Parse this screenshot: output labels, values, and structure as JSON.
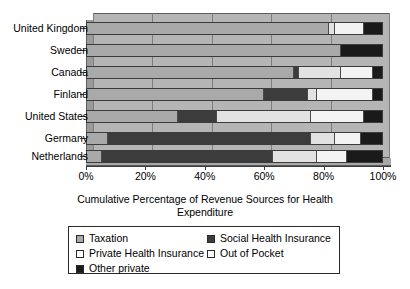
{
  "chart_data": {
    "type": "bar",
    "orientation": "horizontal",
    "stacked": true,
    "title": "",
    "xlabel": "Cumulative Percentage of Revenue Sources for Health Expenditure",
    "ylabel": "",
    "xlim": [
      0,
      100
    ],
    "xticks": [
      "0%",
      "20%",
      "40%",
      "60%",
      "80%",
      "100%"
    ],
    "xtick_values": [
      0,
      20,
      40,
      60,
      80,
      100
    ],
    "grid": true,
    "legend_position": "bottom",
    "categories": [
      "United Kingdom",
      "Sweden",
      "Canada",
      "Finland",
      "United States",
      "Germany",
      "Netherlands"
    ],
    "series": [
      {
        "name": "Taxation",
        "color": "#a9a9a9",
        "values": [
          82,
          86,
          70,
          60,
          31,
          7,
          5
        ]
      },
      {
        "name": "Social Health Insurance",
        "color": "#3c3c3c",
        "values": [
          0,
          0,
          2,
          15,
          13,
          69,
          58
        ]
      },
      {
        "name": "Out of Pocket",
        "color": "#e2e2e2",
        "values": [
          2,
          0,
          14,
          3,
          32,
          8,
          15
        ]
      },
      {
        "name": "Private Health Insurance",
        "color": "#f3f3f3",
        "values": [
          10,
          0,
          11,
          19,
          18,
          9,
          10
        ]
      },
      {
        "name": "Other private",
        "color": "#1a1a1a",
        "values": [
          6,
          14,
          3,
          3,
          6,
          7,
          12
        ]
      }
    ],
    "segment_order": [
      "Taxation",
      "Social Health Insurance",
      "Out of Pocket",
      "Private Health Insurance",
      "Other private"
    ],
    "legend_entries": [
      {
        "label": "Taxation",
        "swatch": "taxation"
      },
      {
        "label": "Social Health Insurance",
        "swatch": "social"
      },
      {
        "label": "Private Health Insurance",
        "swatch": "private"
      },
      {
        "label": "Out of Pocket",
        "swatch": "oop"
      },
      {
        "label": "Other private",
        "swatch": "other"
      }
    ]
  }
}
